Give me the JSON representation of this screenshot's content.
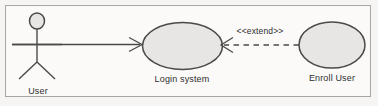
{
  "diagram": {
    "type": "uml-use-case-diagram",
    "canvas": {
      "width": 378,
      "height": 106
    },
    "colors": {
      "background": "#f6f5f3",
      "frame_border": "#a8a6a3",
      "shape_fill": "#e7e6e4",
      "shape_stroke": "#4a4a4a",
      "line": "#4a4a4a",
      "text": "#2e2e2e"
    },
    "actors": [
      {
        "id": "user",
        "label": "User",
        "shape": "stick-figure"
      }
    ],
    "use_cases": [
      {
        "id": "login-system",
        "label": "Login system",
        "shape": "ellipse"
      },
      {
        "id": "enroll-user",
        "label": "Enroll User",
        "shape": "ellipse"
      }
    ],
    "relationships": [
      {
        "id": "user-to-login",
        "from": "user",
        "to": "login-system",
        "style": "solid",
        "arrow": "open-right",
        "label": ""
      },
      {
        "id": "enroll-extends-login",
        "from": "enroll-user",
        "to": "login-system",
        "style": "dashed",
        "arrow": "open-left",
        "label": "<<extend>>"
      }
    ]
  }
}
